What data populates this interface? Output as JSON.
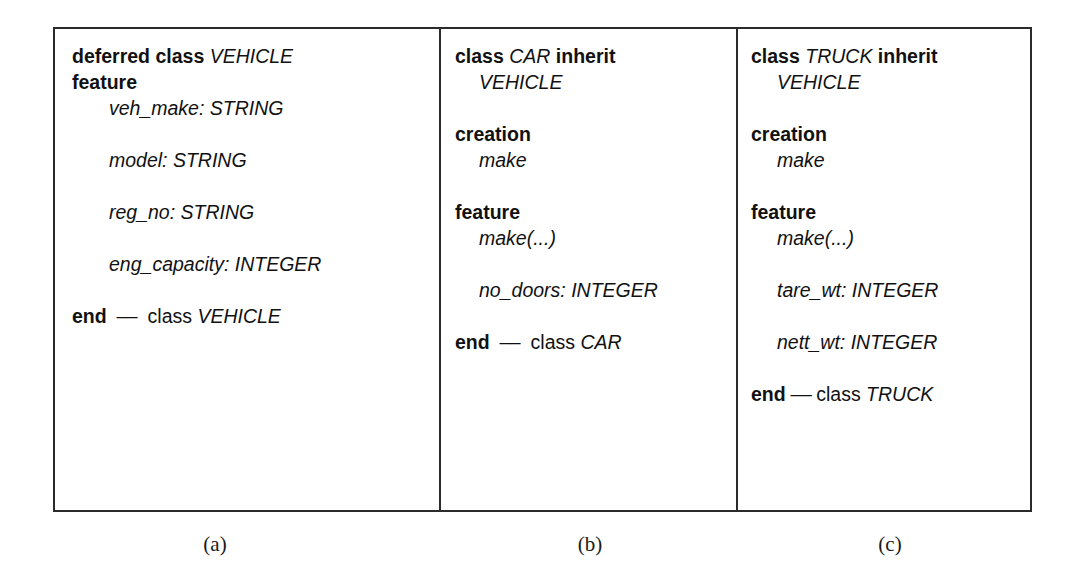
{
  "figure": {
    "panels": [
      {
        "id": "a",
        "caption": "(a)",
        "lines": [
          {
            "indent": 0,
            "segments": [
              {
                "style": "keyword",
                "text": "deferred class "
              },
              {
                "style": "identifier",
                "text": "VEHICLE"
              }
            ]
          },
          {
            "indent": 0,
            "segments": [
              {
                "style": "keyword",
                "text": "feature"
              }
            ]
          },
          {
            "indent": 1,
            "segments": [
              {
                "style": "identifier",
                "text": "veh_make: STRING"
              }
            ]
          },
          {
            "indent": 0,
            "segments": []
          },
          {
            "indent": 1,
            "segments": [
              {
                "style": "identifier",
                "text": "model: STRING"
              }
            ]
          },
          {
            "indent": 0,
            "segments": []
          },
          {
            "indent": 1,
            "segments": [
              {
                "style": "identifier",
                "text": "reg_no: STRING"
              }
            ]
          },
          {
            "indent": 0,
            "segments": []
          },
          {
            "indent": 1,
            "segments": [
              {
                "style": "identifier",
                "text": "eng_capacity: INTEGER"
              }
            ]
          },
          {
            "indent": 0,
            "segments": []
          },
          {
            "indent": 0,
            "segments": [
              {
                "style": "keyword",
                "text": "end"
              },
              {
                "style": "dash",
                "text": "  –– "
              },
              {
                "style": "plain",
                "text": " class "
              },
              {
                "style": "identifier",
                "text": "VEHICLE"
              }
            ]
          }
        ]
      },
      {
        "id": "b",
        "caption": "(b)",
        "lines": [
          {
            "indent": 0,
            "segments": [
              {
                "style": "keyword",
                "text": "class "
              },
              {
                "style": "identifier",
                "text": "CAR"
              },
              {
                "style": "keyword",
                "text": " inherit"
              }
            ]
          },
          {
            "indent": 1,
            "segments": [
              {
                "style": "identifier",
                "text": "VEHICLE"
              }
            ]
          },
          {
            "indent": 0,
            "segments": []
          },
          {
            "indent": 0,
            "segments": [
              {
                "style": "keyword",
                "text": "creation"
              }
            ]
          },
          {
            "indent": 1,
            "segments": [
              {
                "style": "identifier",
                "text": "make"
              }
            ]
          },
          {
            "indent": 0,
            "segments": []
          },
          {
            "indent": 0,
            "segments": [
              {
                "style": "keyword",
                "text": "feature"
              }
            ]
          },
          {
            "indent": 1,
            "segments": [
              {
                "style": "identifier",
                "text": "make(...)"
              }
            ]
          },
          {
            "indent": 0,
            "segments": []
          },
          {
            "indent": 1,
            "segments": [
              {
                "style": "identifier",
                "text": "no_doors: INTEGER"
              }
            ]
          },
          {
            "indent": 0,
            "segments": []
          },
          {
            "indent": 0,
            "segments": [
              {
                "style": "keyword",
                "text": "end"
              },
              {
                "style": "dash",
                "text": "  –– "
              },
              {
                "style": "plain",
                "text": " class "
              },
              {
                "style": "identifier",
                "text": "CAR"
              }
            ]
          }
        ]
      },
      {
        "id": "c",
        "caption": "(c)",
        "lines": [
          {
            "indent": 0,
            "segments": [
              {
                "style": "keyword",
                "text": "class "
              },
              {
                "style": "identifier",
                "text": "TRUCK"
              },
              {
                "style": "keyword",
                "text": " inherit"
              }
            ]
          },
          {
            "indent": 1,
            "segments": [
              {
                "style": "identifier",
                "text": "VEHICLE"
              }
            ]
          },
          {
            "indent": 0,
            "segments": []
          },
          {
            "indent": 0,
            "segments": [
              {
                "style": "keyword",
                "text": "creation"
              }
            ]
          },
          {
            "indent": 1,
            "segments": [
              {
                "style": "identifier",
                "text": "make"
              }
            ]
          },
          {
            "indent": 0,
            "segments": []
          },
          {
            "indent": 0,
            "segments": [
              {
                "style": "keyword",
                "text": "feature"
              }
            ]
          },
          {
            "indent": 1,
            "segments": [
              {
                "style": "identifier",
                "text": "make(...)"
              }
            ]
          },
          {
            "indent": 0,
            "segments": []
          },
          {
            "indent": 1,
            "segments": [
              {
                "style": "identifier",
                "text": "tare_wt: INTEGER"
              }
            ]
          },
          {
            "indent": 0,
            "segments": []
          },
          {
            "indent": 1,
            "segments": [
              {
                "style": "identifier",
                "text": "nett_wt: INTEGER"
              }
            ]
          },
          {
            "indent": 0,
            "segments": []
          },
          {
            "indent": 0,
            "segments": [
              {
                "style": "keyword",
                "text": "end"
              },
              {
                "style": "dash",
                "text": " –– "
              },
              {
                "style": "plain",
                "text": "class "
              },
              {
                "style": "identifier",
                "text": "TRUCK"
              }
            ]
          }
        ]
      }
    ]
  },
  "colors": {
    "border": "#2b2b2b",
    "text": "#111111",
    "background": "#ffffff"
  }
}
